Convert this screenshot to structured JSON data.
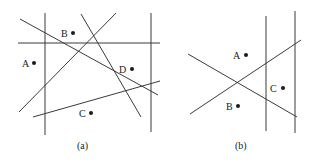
{
  "panels": [
    {
      "caption": "(a)",
      "points": [
        {
          "label": "A",
          "x": 34,
          "y": 63
        },
        {
          "label": "B",
          "x": 73,
          "y": 33
        },
        {
          "label": "C",
          "x": 91,
          "y": 113
        },
        {
          "label": "D",
          "x": 132,
          "y": 69
        }
      ],
      "line_count": 7
    },
    {
      "caption": "(b)",
      "points": [
        {
          "label": "A",
          "x": 246,
          "y": 55
        },
        {
          "label": "B",
          "x": 238,
          "y": 106
        },
        {
          "label": "C",
          "x": 283,
          "y": 88
        }
      ],
      "line_count": 4
    }
  ],
  "colors": {
    "line": "#3a3a3a",
    "point": "#1a1a1a",
    "background": "#ffffff"
  }
}
